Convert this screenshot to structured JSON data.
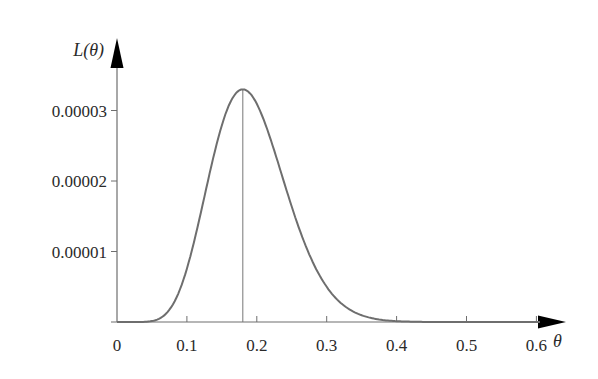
{
  "chart_data": {
    "type": "line",
    "title": "",
    "xlabel": "θ",
    "ylabel": "L(θ)",
    "xlim": [
      0,
      0.62
    ],
    "ylim": [
      0,
      3.7e-05
    ],
    "grid": false,
    "legend": null,
    "x_ticks": [
      "0",
      "0.1",
      "0.2",
      "0.3",
      "0.4",
      "0.5",
      "0.6"
    ],
    "y_ticks": [
      "0.00001",
      "0.00002",
      "0.00003"
    ],
    "series": [
      {
        "name": "L(θ)",
        "color": "#6e6e6e",
        "x": [
          0,
          0.04,
          0.06,
          0.08,
          0.1,
          0.12,
          0.14,
          0.16,
          0.18,
          0.2,
          0.22,
          0.24,
          0.26,
          0.28,
          0.3,
          0.32,
          0.34,
          0.36,
          0.38,
          0.4,
          0.44,
          0.48,
          0.52,
          0.56,
          0.6
        ],
        "values": [
          0,
          0.0,
          1.3e-06,
          6e-06,
          1.42e-05,
          2.32e-05,
          2.98e-05,
          3.27e-05,
          3.3e-05,
          3.16e-05,
          2.83e-05,
          2.4e-05,
          1.95e-05,
          1.52e-05,
          1.14e-05,
          8.3e-06,
          5.8e-06,
          3.9e-06,
          2.6e-06,
          1.6e-06,
          6e-07,
          2e-07,
          1e-07,
          0.0,
          0.0
        ]
      }
    ],
    "annotations": [
      {
        "type": "vertical-line",
        "x": 0.18,
        "label": "maximum likelihood estimate"
      }
    ]
  },
  "labels": {
    "y_axis_title": "L(θ)",
    "x_axis_title": "θ"
  }
}
